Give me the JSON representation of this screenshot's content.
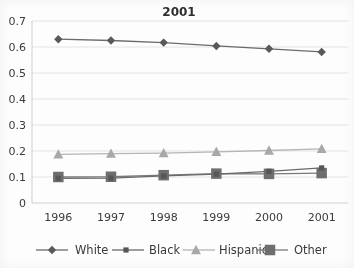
{
  "chart_data": {
    "type": "line",
    "title": "2001",
    "xlabel": "",
    "ylabel": "",
    "categories": [
      "1996",
      "1997",
      "1998",
      "1999",
      "2000",
      "2001"
    ],
    "x": [
      1996,
      1997,
      1998,
      1999,
      2000,
      2001
    ],
    "ylim": [
      0,
      0.7
    ],
    "ytick_labels": [
      "0.7",
      "0.6",
      "0.5",
      "0.4",
      "0.3",
      "0.2",
      "0.1",
      "0"
    ],
    "ytick_values": [
      0.7,
      0.6,
      0.5,
      0.4,
      0.3,
      0.2,
      0.1,
      0
    ],
    "grid": "horizontal",
    "legend_position": "bottom",
    "series": [
      {
        "name": "White",
        "marker": "diamond",
        "color": "#595959",
        "line_color": "#6b6b6b",
        "values": [
          0.63,
          0.625,
          0.617,
          0.604,
          0.593,
          0.581
        ]
      },
      {
        "name": "Black",
        "marker": "square-small",
        "color": "#565656",
        "line_color": "#6b6b6b",
        "values": [
          0.095,
          0.096,
          0.104,
          0.111,
          0.122,
          0.135
        ]
      },
      {
        "name": "Hispanic",
        "marker": "triangle",
        "color": "#a8a8a8",
        "line_color": "#b5b5b5",
        "values": [
          0.187,
          0.19,
          0.192,
          0.197,
          0.202,
          0.208
        ]
      },
      {
        "name": "Other",
        "marker": "square-large",
        "color": "#6e6e6e",
        "line_color": "#7a7a7a",
        "values": [
          0.1,
          0.101,
          0.107,
          0.113,
          0.112,
          0.115
        ]
      }
    ],
    "colors": {
      "white_series": "#595959",
      "black_series": "#565656",
      "hispanic_series": "#a8a8a8",
      "other_series": "#6e6e6e",
      "grid": "#e3e3e3",
      "axis": "#cfcfcf",
      "text": "#3a3a3a",
      "background": "#fdfdfd"
    }
  },
  "legend": {
    "items": [
      {
        "label": "White"
      },
      {
        "label": "Black"
      },
      {
        "label": "Hispanic"
      },
      {
        "label": "Other"
      }
    ]
  }
}
